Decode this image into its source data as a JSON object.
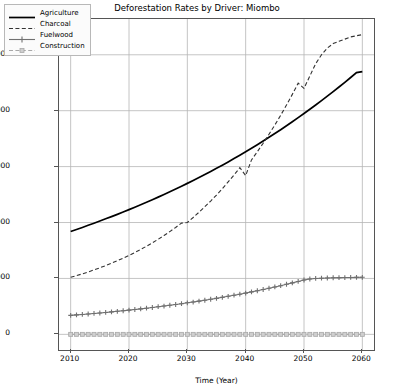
{
  "chart_data": {
    "type": "line",
    "title": "Deforestation Rates by Driver: Miombo",
    "xlabel": "Time (Year)",
    "ylabel": "Hectares per Year",
    "xlim": [
      2008,
      2062
    ],
    "ylim": [
      -1400,
      28200
    ],
    "grid": true,
    "legend_position": "upper left",
    "xticks": [
      2010,
      2020,
      2030,
      2040,
      2050,
      2060
    ],
    "xtick_labels": [
      "2010",
      "2020",
      "2030",
      "2040",
      "2050",
      "2060"
    ],
    "yticks": [
      0,
      5000,
      10000,
      15000,
      20000,
      25000
    ],
    "ytick_labels": [
      "0",
      "5000",
      "10000",
      "15000",
      "20000",
      "25000"
    ],
    "x": [
      2010,
      2011,
      2012,
      2013,
      2014,
      2015,
      2016,
      2017,
      2018,
      2019,
      2020,
      2021,
      2022,
      2023,
      2024,
      2025,
      2026,
      2027,
      2028,
      2029,
      2030,
      2031,
      2032,
      2033,
      2034,
      2035,
      2036,
      2037,
      2038,
      2039,
      2040,
      2041,
      2042,
      2043,
      2044,
      2045,
      2046,
      2047,
      2048,
      2049,
      2050,
      2051,
      2052,
      2053,
      2054,
      2055,
      2056,
      2057,
      2058,
      2059,
      2060
    ],
    "series": [
      {
        "name": "Agriculture",
        "style": "solid",
        "color": "#000000",
        "marker": "none",
        "values": [
          9200,
          9380,
          9560,
          9750,
          9940,
          10130,
          10330,
          10530,
          10730,
          10940,
          11150,
          11370,
          11590,
          11810,
          12040,
          12270,
          12510,
          12750,
          12990,
          13240,
          13500,
          13760,
          14020,
          14290,
          14570,
          14850,
          15130,
          15420,
          15720,
          16020,
          16330,
          16640,
          16960,
          17290,
          17620,
          17960,
          18300,
          18650,
          19010,
          19380,
          19750,
          20130,
          20510,
          20900,
          21300,
          21710,
          22120,
          22540,
          22970,
          23410,
          23500
        ]
      },
      {
        "name": "Charcoal",
        "style": "dashed",
        "color": "#333333",
        "marker": "none",
        "values": [
          5100,
          5250,
          5410,
          5580,
          5760,
          5950,
          6150,
          6360,
          6580,
          6810,
          7060,
          7320,
          7590,
          7880,
          8180,
          8500,
          8840,
          9190,
          9560,
          9950,
          10000,
          10450,
          10920,
          11410,
          11920,
          12460,
          13030,
          13630,
          14250,
          14900,
          14200,
          15600,
          16330,
          17090,
          17890,
          18720,
          19590,
          20500,
          21460,
          22460,
          22000,
          23100,
          24200,
          25000,
          25600,
          26000,
          26200,
          26400,
          26600,
          26700,
          26800
        ]
      },
      {
        "name": "Fuelwood",
        "style": "solid",
        "color": "#707070",
        "marker": "plus",
        "values": [
          1700,
          1740,
          1780,
          1820,
          1870,
          1910,
          1960,
          2010,
          2060,
          2110,
          2170,
          2220,
          2280,
          2340,
          2400,
          2470,
          2530,
          2600,
          2670,
          2740,
          2820,
          2890,
          2970,
          3050,
          3140,
          3220,
          3310,
          3400,
          3500,
          3590,
          3690,
          3800,
          3900,
          4010,
          4120,
          4240,
          4350,
          4480,
          4600,
          4730,
          4860,
          4950,
          5000,
          5020,
          5040,
          5060,
          5070,
          5080,
          5090,
          5095,
          5100
        ]
      },
      {
        "name": "Construction",
        "style": "dashed",
        "color": "#a8a8a8",
        "marker": "square",
        "values": [
          0,
          0,
          0,
          0,
          0,
          0,
          0,
          0,
          0,
          0,
          0,
          0,
          0,
          0,
          0,
          0,
          0,
          0,
          0,
          0,
          0,
          0,
          0,
          0,
          0,
          0,
          0,
          0,
          0,
          0,
          0,
          0,
          0,
          0,
          0,
          0,
          0,
          0,
          0,
          0,
          0,
          0,
          0,
          0,
          0,
          0,
          0,
          0,
          0,
          0,
          0
        ]
      }
    ]
  },
  "legend": {
    "items": [
      {
        "label": "Agriculture"
      },
      {
        "label": "Charcoal"
      },
      {
        "label": "Fuelwood"
      },
      {
        "label": "Construction"
      }
    ]
  }
}
